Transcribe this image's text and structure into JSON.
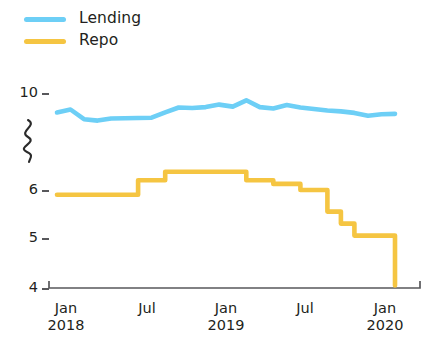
{
  "legend": {
    "position": "top-left",
    "items": [
      {
        "label": "Lending",
        "color": "#6DCFF6",
        "key": "lending"
      },
      {
        "label": "Repo",
        "color": "#F5C542",
        "key": "repo"
      }
    ]
  },
  "axes": {
    "y": {
      "ticks": [
        "10",
        "6",
        "5",
        "4"
      ],
      "broken": true,
      "break_symbol": "zigzag"
    },
    "x": {
      "ticks": [
        {
          "month": "Jan",
          "year": "2018"
        },
        {
          "month": "Jul",
          "year": ""
        },
        {
          "month": "Jan",
          "year": "2019"
        },
        {
          "month": "Jul",
          "year": ""
        },
        {
          "month": "Jan",
          "year": "2020"
        }
      ]
    }
  },
  "chart_data": {
    "type": "line",
    "title": "",
    "subtitle": "",
    "xlabel": "",
    "ylabel": "",
    "grid": false,
    "legend_position": "top-left",
    "axis_break": {
      "between": [
        6.9,
        9.0
      ],
      "note": "y-axis is broken/compressed between the 6 and 10 tick labels"
    },
    "ylim": [
      4,
      10
    ],
    "yticks": [
      10,
      6,
      5,
      4
    ],
    "x": [
      "2018-01",
      "2018-02",
      "2018-03",
      "2018-04",
      "2018-05",
      "2018-06",
      "2018-07",
      "2018-08",
      "2018-09",
      "2018-10",
      "2018-11",
      "2018-12",
      "2019-01",
      "2019-02",
      "2019-03",
      "2019-04",
      "2019-05",
      "2019-06",
      "2019-07",
      "2019-08",
      "2019-09",
      "2019-10",
      "2019-11",
      "2019-12",
      "2020-01",
      "2020-02"
    ],
    "xticklabels": [
      "Jan 2018",
      "Jul",
      "Jan 2019",
      "Jul",
      "Jan 2020"
    ],
    "series": [
      {
        "name": "Lending",
        "color": "#6DCFF6",
        "style": "line",
        "values": [
          9.2,
          9.32,
          8.92,
          8.86,
          8.95,
          8.96,
          8.97,
          8.98,
          9.2,
          9.4,
          9.38,
          9.42,
          9.52,
          9.44,
          9.7,
          9.42,
          9.36,
          9.5,
          9.4,
          9.34,
          9.28,
          9.24,
          9.18,
          9.06,
          9.12,
          9.14
        ]
      },
      {
        "name": "Repo",
        "color": "#F5C542",
        "style": "step",
        "values": [
          5.9,
          5.9,
          5.9,
          5.9,
          5.9,
          5.9,
          6.4,
          6.4,
          6.75,
          6.75,
          6.75,
          6.75,
          6.75,
          6.75,
          6.4,
          6.4,
          6.25,
          6.25,
          6.0,
          6.0,
          5.55,
          5.3,
          5.05,
          5.05,
          5.05,
          4.05
        ]
      }
    ]
  }
}
